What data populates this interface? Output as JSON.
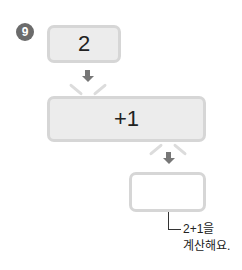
{
  "problem": {
    "number": "9",
    "start_value": "2",
    "operation": "+1",
    "result_value": "",
    "hint_line1": "2+1을",
    "hint_line2": "계산해요."
  },
  "colors": {
    "badge": "#6b6b6b",
    "box_fill": "#ececec",
    "box_border": "#d6d6d6",
    "arrow": "#777777"
  }
}
